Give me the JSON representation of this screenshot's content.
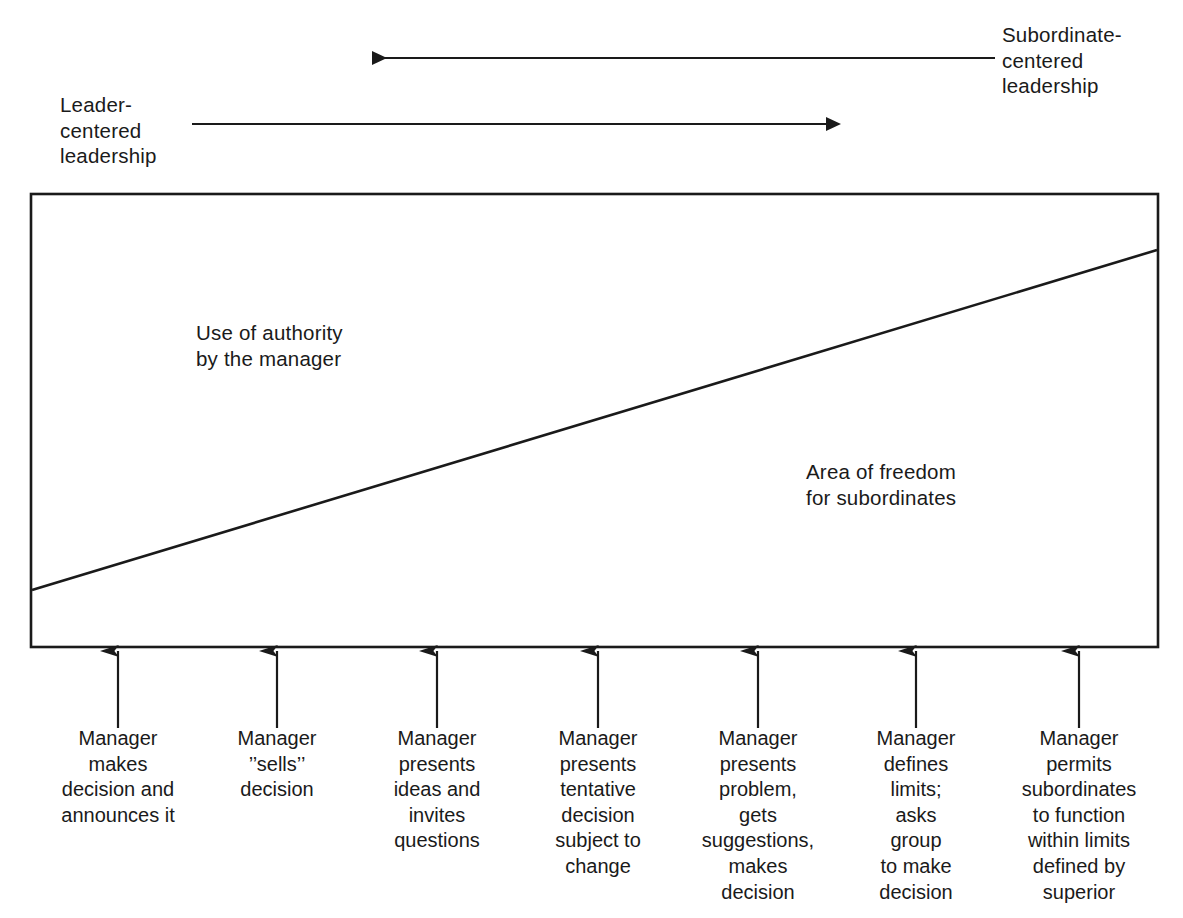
{
  "figure": {
    "kind": "leadership-continuum-diagram",
    "top_axis": {
      "left_label": "Leader-\ncentered\nleadership",
      "right_label": "Subordinate-\ncentered\nleadership",
      "arrows": [
        {
          "name": "subordinate-centered-arrow",
          "direction": "left",
          "from_x": 995,
          "to_x": 358,
          "y": 58
        },
        {
          "name": "leader-centered-arrow",
          "direction": "right",
          "from_x": 192,
          "to_x": 840,
          "y": 124
        }
      ]
    },
    "box": {
      "name": "continuum-box",
      "x": 31,
      "y": 194,
      "width": 1127,
      "height": 453,
      "left_region_label": "Use of authority\nby the manager",
      "right_region_label": "Area of freedom\nfor subordinates",
      "divider": {
        "name": "diagonal-divider",
        "x1": 32,
        "y1": 590,
        "x2": 1157,
        "y2": 250
      }
    },
    "styles": [
      {
        "id": 1,
        "x": 118,
        "text": "Manager\nmakes\ndecision and\nannounces it"
      },
      {
        "id": 2,
        "x": 277,
        "text": "Manager\n’’sells’’\ndecision"
      },
      {
        "id": 3,
        "x": 437,
        "text": "Manager\npresents\nideas and\ninvites\nquestions"
      },
      {
        "id": 4,
        "x": 598,
        "text": "Manager\npresents\ntentative\ndecision\nsubject to\nchange"
      },
      {
        "id": 5,
        "x": 758,
        "text": "Manager\npresents\nproblem,\ngets\nsuggestions,\nmakes\ndecision"
      },
      {
        "id": 6,
        "x": 916,
        "text": "Manager\ndefines\nlimits;\nasks\ngroup\nto make\ndecision"
      },
      {
        "id": 7,
        "x": 1079,
        "text": "Manager\npermits\nsubordinates\nto function\nwithin limits\ndefined by\nsuperior"
      }
    ],
    "colors": {
      "ink": "#1a1a1a",
      "background": "#ffffff"
    }
  }
}
